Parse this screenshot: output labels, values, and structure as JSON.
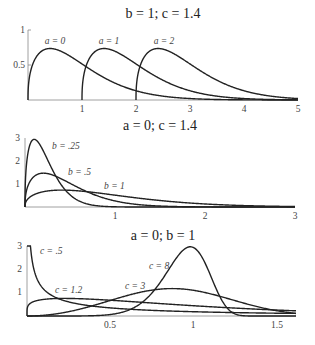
{
  "chart_data": [
    {
      "type": "line",
      "title": "b = 1;  c = 1.4",
      "xlabel": "",
      "ylabel": "",
      "xlim": [
        0,
        5
      ],
      "ylim": [
        0,
        1
      ],
      "xticks": [
        "1",
        "2",
        "3",
        "4",
        "5"
      ],
      "yticks": [
        "0.5",
        "1"
      ],
      "grid": false,
      "series": [
        {
          "name": "a = 0",
          "a": 0,
          "b": 1,
          "c": 1.4,
          "x": [
            0,
            0.05,
            0.1,
            0.2,
            0.3,
            0.41,
            0.6,
            0.8,
            1.0,
            1.5,
            2.0,
            2.5,
            3.0,
            4.0,
            5.0
          ],
          "values": [
            0,
            0.43,
            0.55,
            0.68,
            0.73,
            0.75,
            0.73,
            0.67,
            0.52,
            0.33,
            0.18,
            0.09,
            0.04,
            0.007,
            0.001
          ]
        },
        {
          "name": "a = 1",
          "a": 1,
          "b": 1,
          "c": 1.4,
          "x": [
            1,
            1.05,
            1.1,
            1.2,
            1.3,
            1.41,
            1.6,
            1.8,
            2.0,
            2.5,
            3.0,
            3.5,
            4.0,
            5.0
          ],
          "values": [
            0,
            0.43,
            0.55,
            0.68,
            0.73,
            0.75,
            0.73,
            0.67,
            0.52,
            0.33,
            0.18,
            0.09,
            0.04,
            0.007
          ]
        },
        {
          "name": "a = 2",
          "a": 2,
          "b": 1,
          "c": 1.4,
          "x": [
            2,
            2.05,
            2.1,
            2.2,
            2.3,
            2.41,
            2.6,
            2.8,
            3.0,
            3.5,
            4.0,
            4.5,
            5.0
          ],
          "values": [
            0,
            0.43,
            0.55,
            0.68,
            0.73,
            0.75,
            0.73,
            0.67,
            0.52,
            0.33,
            0.18,
            0.09,
            0.04
          ]
        }
      ]
    },
    {
      "type": "line",
      "title": "a = 0;   c = 1.4",
      "xlabel": "",
      "ylabel": "",
      "xlim": [
        0,
        3
      ],
      "ylim": [
        0,
        3
      ],
      "xticks": [
        "1",
        "2",
        "3"
      ],
      "yticks": [
        "1",
        "2",
        "3"
      ],
      "grid": false,
      "series": [
        {
          "name": "b = .25",
          "a": 0,
          "b": 0.25,
          "c": 1.4
        },
        {
          "name": "b = .5",
          "a": 0,
          "b": 0.5,
          "c": 1.4
        },
        {
          "name": "b = 1",
          "a": 0,
          "b": 1,
          "c": 1.4
        }
      ]
    },
    {
      "type": "line",
      "title": "a = 0;  b = 1",
      "xlabel": "",
      "ylabel": "",
      "xlim": [
        0,
        1.62
      ],
      "ylim": [
        0,
        3
      ],
      "xticks": [
        "0.5",
        "1",
        "1.5"
      ],
      "yticks": [
        "1",
        "2",
        "3"
      ],
      "grid": false,
      "series": [
        {
          "name": "c = .5",
          "a": 0,
          "b": 1,
          "c": 0.5
        },
        {
          "name": "c = 1.2",
          "a": 0,
          "b": 1,
          "c": 1.2
        },
        {
          "name": "c = 3",
          "a": 0,
          "b": 1,
          "c": 3
        },
        {
          "name": "c = 8",
          "a": 0,
          "b": 1,
          "c": 8
        }
      ]
    }
  ],
  "panels": [
    {
      "title": "b = 1;  c = 1.4",
      "labels": [
        "a = 0",
        "a = 1",
        "a = 2"
      ],
      "xticks": [
        "1",
        "2",
        "3",
        "4",
        "5"
      ],
      "yticks": [
        "0.5",
        "1"
      ]
    },
    {
      "title": "a = 0;   c = 1.4",
      "labels": [
        "b = .25",
        "b = .5",
        "b = 1"
      ],
      "xticks": [
        "1",
        "2",
        "3"
      ],
      "yticks": [
        "1",
        "2",
        "3"
      ]
    },
    {
      "title": "a = 0;  b = 1",
      "labels": [
        "c = .5",
        "c = 1.2",
        "c = 3",
        "c = 8"
      ],
      "xticks": [
        "0.5",
        "1",
        "1.5"
      ],
      "yticks": [
        "1",
        "2",
        "3"
      ]
    }
  ]
}
